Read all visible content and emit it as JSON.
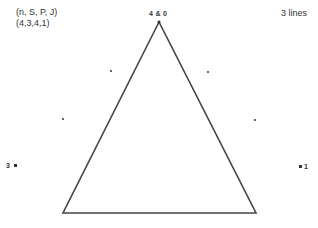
{
  "diagram": {
    "header_left": {
      "line1": "(n, S, P, J)",
      "line2": "(4,3,4,1)"
    },
    "header_right": "3 lines",
    "vertex_labels": {
      "top": "4 & 0",
      "left": "3",
      "right": "1"
    },
    "shape": "triangle",
    "line_color": "#444444",
    "points": [
      {
        "x": 111,
        "y": 71
      },
      {
        "x": 208,
        "y": 72
      },
      {
        "x": 63,
        "y": 119
      },
      {
        "x": 255,
        "y": 120
      },
      {
        "x": 14,
        "y": 165
      },
      {
        "x": 300,
        "y": 166
      }
    ]
  }
}
